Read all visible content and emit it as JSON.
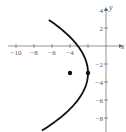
{
  "chart_data": {
    "type": "line",
    "title": "",
    "xlabel": "x",
    "ylabel": "y",
    "xlim": [
      -11.5,
      2
    ],
    "ylim": [
      -9.5,
      5
    ],
    "grid": false,
    "x_ticks": [
      -10,
      -8,
      -6,
      -4,
      -2
    ],
    "x_tick_labels": [
      "−10",
      "−8",
      "−6",
      "−4"
    ],
    "y_ticks": [
      4,
      2,
      -2,
      -4,
      -6,
      -8
    ],
    "y_tick_labels": [
      "4",
      "2",
      "−2",
      "−4",
      "−6",
      "−8"
    ],
    "series": [
      {
        "name": "parabola",
        "equation": "(y+3)^2 = -8(x+2)",
        "color": "#111111",
        "y_range": [
          -9.4,
          2.9
        ]
      }
    ],
    "points": [
      {
        "name": "focus",
        "x": -4,
        "y": -3
      },
      {
        "name": "vertex",
        "x": -2,
        "y": -3
      }
    ]
  },
  "axes": {
    "x_axis_label": "x",
    "y_axis_label": "y"
  }
}
